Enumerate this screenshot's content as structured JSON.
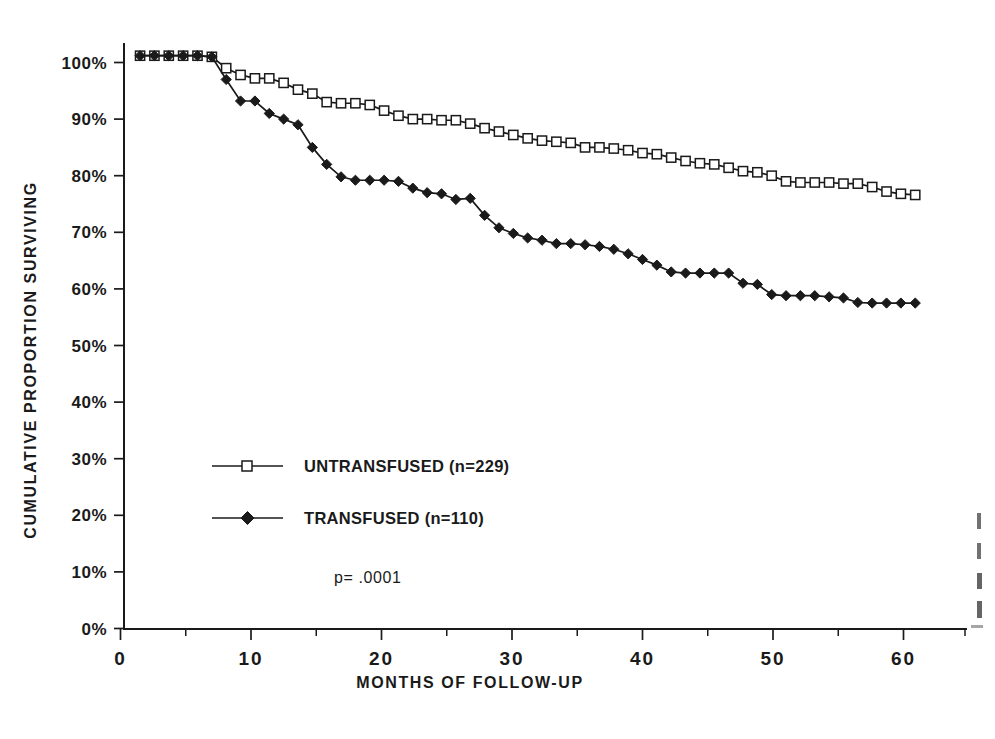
{
  "chart_data": {
    "type": "line",
    "title": "",
    "subtitle": "",
    "xlabel": "MONTHS OF FOLLOW-UP",
    "ylabel": "CUMULATIVE PROPORTION SURVIVING",
    "xlim": [
      0,
      64
    ],
    "ylim": [
      0,
      105
    ],
    "grid": false,
    "legend_position": "center-left-inside",
    "x_tick_labels": [
      "0",
      "10",
      "20",
      "30",
      "40",
      "50",
      "60"
    ],
    "x_ticks": [
      0,
      10,
      20,
      30,
      40,
      50,
      60
    ],
    "x_minor_ticks": [
      5,
      15,
      25,
      35,
      45,
      55
    ],
    "y_tick_labels": [
      "0%",
      "10%",
      "20%",
      "30%",
      "40%",
      "50%",
      "60%",
      "70%",
      "80%",
      "90%",
      "100%"
    ],
    "y_ticks": [
      0,
      10,
      20,
      30,
      40,
      50,
      60,
      70,
      80,
      90,
      100
    ],
    "annotations": [
      {
        "text": "p=  .0001",
        "x": 22,
        "y": 11.5
      }
    ],
    "series": [
      {
        "name": "UNTRANSFUSED (n=229)",
        "legend_label": "UNTRANSFUSED (n=229)",
        "marker": "open-square",
        "color": "#1a1a1a",
        "n": 229,
        "x": [
          1.5,
          2.6,
          3.7,
          4.8,
          5.9,
          7.0,
          8.1,
          9.2,
          10.3,
          11.4,
          12.5,
          13.6,
          14.7,
          15.8,
          16.9,
          18.0,
          19.1,
          20.2,
          21.3,
          22.4,
          23.5,
          24.6,
          25.7,
          26.8,
          27.9,
          29.0,
          30.1,
          31.2,
          32.3,
          33.4,
          34.5,
          35.6,
          36.7,
          37.8,
          38.9,
          40.0,
          41.1,
          42.2,
          43.3,
          44.4,
          45.5,
          46.6,
          47.7,
          48.8,
          49.9,
          51.0,
          52.1,
          53.2,
          54.3,
          55.4,
          56.5,
          57.6,
          58.7,
          59.8,
          60.9
        ],
        "y": [
          101.2,
          101.2,
          101.2,
          101.2,
          101.2,
          101.0,
          99.0,
          97.8,
          97.2,
          97.2,
          96.4,
          95.2,
          94.5,
          93.0,
          92.8,
          92.8,
          92.5,
          91.5,
          90.6,
          90.0,
          90.0,
          89.8,
          89.8,
          89.2,
          88.4,
          87.8,
          87.2,
          86.6,
          86.2,
          86.0,
          85.8,
          85.0,
          85.0,
          84.8,
          84.5,
          84.0,
          83.8,
          83.2,
          82.6,
          82.2,
          82.0,
          81.4,
          80.8,
          80.6,
          80.0,
          79.0,
          78.8,
          78.8,
          78.8,
          78.6,
          78.6,
          78.0,
          77.2,
          76.8,
          76.6
        ]
      },
      {
        "name": "TRANSFUSED (n=110)",
        "legend_label": "TRANSFUSED (n=110)",
        "marker": "filled-diamond",
        "color": "#1a1a1a",
        "n": 110,
        "x": [
          1.5,
          2.6,
          3.7,
          4.8,
          5.9,
          7.0,
          8.1,
          9.2,
          10.3,
          11.4,
          12.5,
          13.6,
          14.7,
          15.8,
          16.9,
          18.0,
          19.1,
          20.2,
          21.3,
          22.4,
          23.5,
          24.6,
          25.7,
          26.8,
          27.9,
          29.0,
          30.1,
          31.2,
          32.3,
          33.4,
          34.5,
          35.6,
          36.7,
          37.8,
          38.9,
          40.0,
          41.1,
          42.2,
          43.3,
          44.4,
          45.5,
          46.6,
          47.7,
          48.8,
          49.9,
          51.0,
          52.1,
          53.2,
          54.3,
          55.4,
          56.5,
          57.6,
          58.7,
          59.8,
          60.9
        ],
        "y": [
          101.2,
          101.2,
          101.2,
          101.2,
          101.2,
          101.0,
          97.0,
          93.2,
          93.2,
          91.0,
          90.0,
          89.0,
          85.0,
          82.0,
          79.8,
          79.2,
          79.2,
          79.2,
          79.0,
          77.8,
          77.0,
          76.8,
          75.8,
          76.0,
          73.0,
          70.8,
          69.8,
          69.0,
          68.6,
          68.0,
          68.0,
          67.8,
          67.5,
          67.0,
          66.2,
          65.2,
          64.2,
          63.0,
          62.8,
          62.8,
          62.8,
          62.8,
          61.0,
          60.8,
          59.0,
          58.8,
          58.8,
          58.8,
          58.6,
          58.4,
          57.6,
          57.5,
          57.5,
          57.5,
          57.5
        ]
      }
    ]
  },
  "legend": {
    "items": [
      {
        "label": "UNTRANSFUSED (n=229)",
        "marker": "open-square"
      },
      {
        "label": "TRANSFUSED (n=110)",
        "marker": "filled-diamond"
      }
    ]
  },
  "pvalue": {
    "text": "p=  .0001"
  },
  "axes": {
    "x_title": "MONTHS OF FOLLOW-UP",
    "y_title": "CUMULATIVE PROPORTION SURVIVING"
  }
}
